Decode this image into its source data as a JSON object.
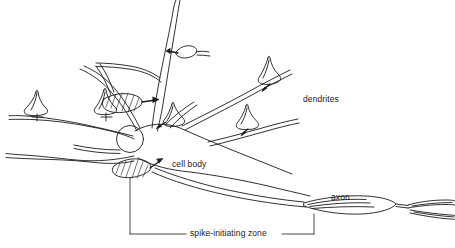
{
  "figure": {
    "background_color": "#ffffff",
    "ink_color": "#1a1a1a",
    "width": 455,
    "height": 248
  },
  "labels": {
    "dendrites": "dendrites",
    "cell_body": "cell body",
    "axon": "axon",
    "spike_initiating_zone": "spike-initiating zone"
  },
  "parts": {
    "nucleus": "nucleus",
    "soma": "soma",
    "axon_hillock": "axon hillock",
    "myelin_segment": "myelin-segment",
    "node_of_ranvier": "node-of-ranvier",
    "axon_terminal_branch": "axon-terminal-branch",
    "synaptic_bouton": "synaptic-bouton",
    "shaded_bouton": "shaded-synaptic-bouton",
    "arrowhead": "arrowhead"
  },
  "leader_lines": {
    "spike_zone_left_rule": "leader-line-left",
    "spike_zone_right_rule": "leader-line-right",
    "spike_zone_vertical_drop": "leader-line-vertical",
    "spike_zone_bracket": "bracket-to-axon"
  }
}
